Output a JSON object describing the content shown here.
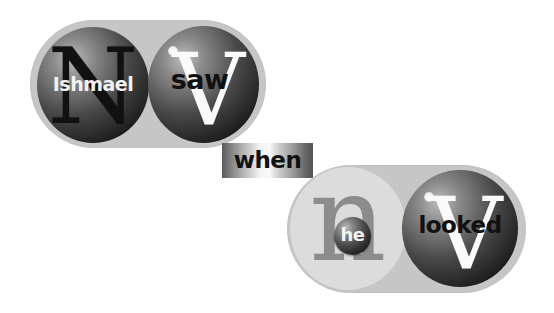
{
  "diagram": {
    "type": "sentence-parse-spheres",
    "colors": {
      "pill": "#c6c6c6",
      "light_circle": "#dcdcdc",
      "sphere_dark": "#0a0a0a",
      "sphere_light": "#bdbdbd",
      "noun_letter_big": "#111111",
      "verb_letter_big": "#ffffff",
      "pronoun_letter_big": "#8c8c8c"
    },
    "clause1": {
      "subject": {
        "category": "N",
        "word": "Ishmael"
      },
      "verb": {
        "category": "V",
        "word": "saw"
      }
    },
    "conjunction": {
      "word": "when"
    },
    "clause2": {
      "subject": {
        "category": "n",
        "word": "he"
      },
      "verb": {
        "category": "V",
        "word": "looked"
      }
    }
  }
}
